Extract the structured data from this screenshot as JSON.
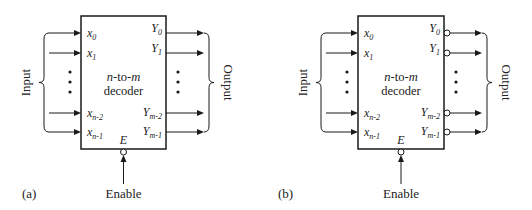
{
  "figure": {
    "panels": [
      {
        "id": "a",
        "caption": "(a)",
        "title_line1_parts": [
          {
            "text": "n",
            "italic": true
          },
          {
            "text": "-to-",
            "italic": false
          },
          {
            "text": "m",
            "italic": true
          }
        ],
        "title_line2": "decoder",
        "input_label": "Input",
        "output_label": "Output",
        "enable_label": "Enable",
        "enable_pin": "E",
        "enable_active_low": true,
        "outputs_active_low": false,
        "inputs": [
          {
            "base": "x",
            "sub": "0"
          },
          {
            "base": "x",
            "sub": "1"
          },
          {
            "base": "x",
            "sub": "n-2"
          },
          {
            "base": "x",
            "sub": "n-1"
          }
        ],
        "outputs": [
          {
            "base": "Y",
            "sub": "0"
          },
          {
            "base": "Y",
            "sub": "1"
          },
          {
            "base": "Y",
            "sub": "m-2"
          },
          {
            "base": "Y",
            "sub": "m-1"
          }
        ]
      },
      {
        "id": "b",
        "caption": "(b)",
        "title_line1_parts": [
          {
            "text": "n",
            "italic": true
          },
          {
            "text": "-to-",
            "italic": false
          },
          {
            "text": "m",
            "italic": true
          }
        ],
        "title_line2": "decoder",
        "input_label": "Input",
        "output_label": "Output",
        "enable_label": "Enable",
        "enable_pin": "E",
        "enable_active_low": true,
        "outputs_active_low": true,
        "inputs": [
          {
            "base": "x",
            "sub": "0"
          },
          {
            "base": "x",
            "sub": "1"
          },
          {
            "base": "x",
            "sub": "n-2"
          },
          {
            "base": "x",
            "sub": "n-1"
          }
        ],
        "outputs": [
          {
            "base": "Y",
            "sub": "0"
          },
          {
            "base": "Y",
            "sub": "1"
          },
          {
            "base": "Y",
            "sub": "m-2"
          },
          {
            "base": "Y",
            "sub": "m-1"
          }
        ]
      }
    ]
  }
}
